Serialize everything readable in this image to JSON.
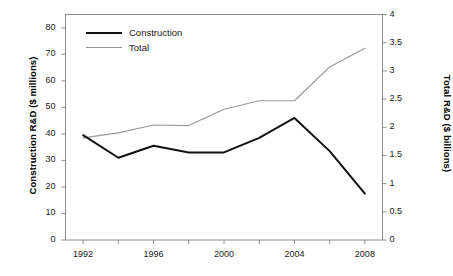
{
  "chart_data": {
    "type": "line",
    "title": "",
    "xlabel": "",
    "ylabel": "Construction R&D ($ millions)",
    "y2label": "Total R&D ($ billions)",
    "x": [
      1992,
      1994,
      1996,
      1998,
      2000,
      2002,
      2004,
      2006,
      2008
    ],
    "xlim": [
      1991,
      2009
    ],
    "xticks": [
      1992,
      1994,
      1996,
      1998,
      2000,
      2002,
      2004,
      2006,
      2008
    ],
    "xtick_labels": [
      "1992",
      "",
      "1996",
      "",
      "2000",
      "",
      "2004",
      "",
      "2008"
    ],
    "ylim": [
      0,
      85
    ],
    "yticks": [
      0,
      10,
      20,
      30,
      40,
      50,
      60,
      70,
      80
    ],
    "ytick_labels": [
      "0",
      "10",
      "20",
      "30",
      "40",
      "50",
      "60",
      "70",
      "80"
    ],
    "y2lim": [
      0,
      4
    ],
    "y2ticks": [
      0,
      0.5,
      1,
      1.5,
      2,
      2.5,
      3,
      3.5,
      4
    ],
    "y2tick_labels": [
      "0",
      "0.5",
      "1",
      "1.5",
      "2",
      "2.5",
      "3",
      "3.5",
      "4"
    ],
    "grid": false,
    "legend_position": "upper left",
    "series": [
      {
        "name": "Construction",
        "axis": "left",
        "unit": "$ millions",
        "color": "#111111",
        "line_width": 2,
        "values": [
          39.5,
          31.0,
          35.5,
          33.0,
          33.0,
          38.5,
          46.0,
          33.5,
          17.5
        ]
      },
      {
        "name": "Total",
        "axis": "right",
        "unit": "$ billions",
        "color": "#9a9a9a",
        "line_width": 1.2,
        "values": [
          1.81,
          1.9,
          2.04,
          2.03,
          2.32,
          2.47,
          2.47,
          3.07,
          3.4
        ]
      }
    ]
  },
  "legend": {
    "items": [
      {
        "label": "Construction"
      },
      {
        "label": "Total"
      }
    ]
  },
  "axes": {
    "y_left_title": "Construction R&D ($ millions)",
    "y_right_title": "Total R&D ($ billions)"
  },
  "colors": {
    "construction": "#111111",
    "total": "#9a9a9a",
    "frame": "#8c8c8c",
    "background": "#ffffff"
  }
}
